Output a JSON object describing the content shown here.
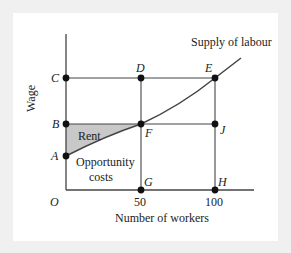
{
  "figure": {
    "curve_label": "Supply of labour",
    "y_axis_label": "Wage",
    "x_axis_label": "Number of workers",
    "origin_label": "O",
    "x_ticks": [
      "50",
      "100"
    ],
    "region_labels": {
      "rent": "Rent",
      "opportunity_line1": "Opportunity",
      "opportunity_line2": "costs"
    },
    "points": {
      "A": "A",
      "B": "B",
      "C": "C",
      "D": "D",
      "E": "E",
      "F": "F",
      "G": "G",
      "H": "H",
      "J": "J"
    },
    "colors": {
      "line": "#444444",
      "point": "#111111",
      "rent_fill": "#c8c8c8",
      "frame": "#f0f0f0"
    }
  }
}
